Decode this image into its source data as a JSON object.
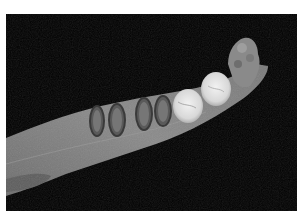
{
  "image": {
    "subject": "fossil mandible with teeth, occlusal view",
    "background": "#000000",
    "border": "#ffffff",
    "colors": {
      "bone": "#7a7a7a",
      "bone_light": "#a8a8a8",
      "tooth_enamel": "#e6e6e6",
      "worn_tooth": "#5a5a5a",
      "ramus": "#8c8c8c"
    }
  }
}
